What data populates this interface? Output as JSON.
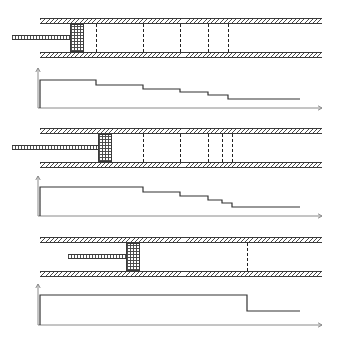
{
  "figure": {
    "panel_count": 3,
    "line_color": "#333333",
    "axis_color": "#8a8a8a",
    "hatch_color": "#4a4a4a"
  },
  "panels": [
    {
      "id": "panel-1",
      "label": "first-stage",
      "tube": {
        "x": 40,
        "y": 18,
        "width": 282,
        "height": 40,
        "wall_thickness": 6
      },
      "piston": {
        "x": 70,
        "y": 24,
        "width": 14,
        "height": 28
      },
      "rod": {
        "x": 12,
        "y": 35,
        "width": 58,
        "height": 5
      },
      "markers": [
        96,
        143,
        180,
        208,
        228
      ],
      "plot": {
        "x": 38,
        "y": 72,
        "width": 284,
        "height": 42,
        "axis_origin_y": 108,
        "steps": [
          {
            "x_start": 40,
            "x_end": 96,
            "y": 80
          },
          {
            "x_start": 96,
            "x_end": 143,
            "y": 85
          },
          {
            "x_start": 143,
            "x_end": 180,
            "y": 89
          },
          {
            "x_start": 180,
            "x_end": 208,
            "y": 92
          },
          {
            "x_start": 208,
            "x_end": 228,
            "y": 95
          },
          {
            "x_start": 228,
            "x_end": 300,
            "y": 99
          }
        ]
      }
    },
    {
      "id": "panel-2",
      "label": "second-stage",
      "tube": {
        "x": 40,
        "y": 128,
        "width": 282,
        "height": 40,
        "wall_thickness": 6
      },
      "piston": {
        "x": 98,
        "y": 134,
        "width": 14,
        "height": 28
      },
      "rod": {
        "x": 12,
        "y": 145,
        "width": 86,
        "height": 5
      },
      "markers": [
        143,
        180,
        208,
        222,
        232
      ],
      "plot": {
        "x": 38,
        "y": 180,
        "width": 284,
        "height": 42,
        "axis_origin_y": 216,
        "steps": [
          {
            "x_start": 40,
            "x_end": 143,
            "y": 187
          },
          {
            "x_start": 143,
            "x_end": 180,
            "y": 192
          },
          {
            "x_start": 180,
            "x_end": 208,
            "y": 196
          },
          {
            "x_start": 208,
            "x_end": 222,
            "y": 200
          },
          {
            "x_start": 222,
            "x_end": 232,
            "y": 203
          },
          {
            "x_start": 232,
            "x_end": 300,
            "y": 207
          }
        ]
      }
    },
    {
      "id": "panel-3",
      "label": "third-stage",
      "tube": {
        "x": 40,
        "y": 237,
        "width": 282,
        "height": 40,
        "wall_thickness": 6
      },
      "piston": {
        "x": 126,
        "y": 243,
        "width": 14,
        "height": 28
      },
      "rod": {
        "x": 68,
        "y": 254,
        "width": 58,
        "height": 5
      },
      "markers": [
        247
      ],
      "plot": {
        "x": 38,
        "y": 288,
        "width": 284,
        "height": 42,
        "axis_origin_y": 325,
        "steps": [
          {
            "x_start": 40,
            "x_end": 247,
            "y": 295
          },
          {
            "x_start": 247,
            "x_end": 300,
            "y": 311
          }
        ]
      }
    }
  ]
}
